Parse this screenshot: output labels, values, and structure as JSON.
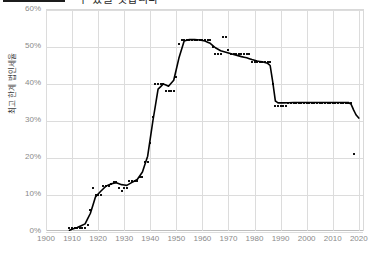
{
  "header": {
    "title_fragment": "수 있을 것입니다",
    "logo_name": "black-bar-logo"
  },
  "chart_data": {
    "type": "scatter",
    "title": "",
    "xlabel": "",
    "ylabel": "최고 한계 법인세율",
    "xlim": [
      1900,
      2022
    ],
    "ylim": [
      0,
      60
    ],
    "grid": true,
    "legend": "none",
    "xticks": [
      1900,
      1910,
      1920,
      1930,
      1940,
      1950,
      1960,
      1970,
      1980,
      1990,
      2000,
      2010,
      2020
    ],
    "xticklabels": [
      "1900",
      "1910",
      "1920",
      "1930",
      "1940",
      "1950",
      "1960",
      "1970",
      "1980",
      "1990",
      "2000",
      "2010",
      "2020"
    ],
    "yticks": [
      0,
      10,
      20,
      30,
      40,
      50,
      60
    ],
    "yticklabels": [
      "0%",
      "10%",
      "20%",
      "30%",
      "40%",
      "50%",
      "60%"
    ],
    "series": [
      {
        "name": "Top marginal corporate tax rate (observations)",
        "marker": "square",
        "color": "#111111",
        "points": [
          [
            1909,
            1.0
          ],
          [
            1910,
            1.0
          ],
          [
            1911,
            1.0
          ],
          [
            1912,
            1.0
          ],
          [
            1913,
            1.0
          ],
          [
            1914,
            1.0
          ],
          [
            1915,
            1.0
          ],
          [
            1916,
            2.0
          ],
          [
            1917,
            6.0
          ],
          [
            1918,
            12.0
          ],
          [
            1919,
            10.0
          ],
          [
            1920,
            10.0
          ],
          [
            1921,
            10.0
          ],
          [
            1922,
            12.5
          ],
          [
            1923,
            12.5
          ],
          [
            1924,
            12.5
          ],
          [
            1925,
            13.0
          ],
          [
            1926,
            13.5
          ],
          [
            1927,
            13.5
          ],
          [
            1928,
            12.0
          ],
          [
            1929,
            11.0
          ],
          [
            1930,
            12.0
          ],
          [
            1931,
            12.0
          ],
          [
            1932,
            13.75
          ],
          [
            1933,
            13.75
          ],
          [
            1934,
            13.75
          ],
          [
            1935,
            13.75
          ],
          [
            1936,
            15.0
          ],
          [
            1937,
            15.0
          ],
          [
            1938,
            19.0
          ],
          [
            1939,
            19.0
          ],
          [
            1940,
            24.0
          ],
          [
            1941,
            31.0
          ],
          [
            1942,
            40.0
          ],
          [
            1943,
            40.0
          ],
          [
            1944,
            40.0
          ],
          [
            1945,
            40.0
          ],
          [
            1946,
            38.0
          ],
          [
            1947,
            38.0
          ],
          [
            1948,
            38.0
          ],
          [
            1949,
            38.0
          ],
          [
            1950,
            42.0
          ],
          [
            1951,
            50.75
          ],
          [
            1952,
            52.0
          ],
          [
            1953,
            52.0
          ],
          [
            1954,
            52.0
          ],
          [
            1955,
            52.0
          ],
          [
            1956,
            52.0
          ],
          [
            1957,
            52.0
          ],
          [
            1958,
            52.0
          ],
          [
            1959,
            52.0
          ],
          [
            1960,
            52.0
          ],
          [
            1961,
            52.0
          ],
          [
            1962,
            52.0
          ],
          [
            1963,
            52.0
          ],
          [
            1964,
            50.0
          ],
          [
            1965,
            48.0
          ],
          [
            1966,
            48.0
          ],
          [
            1967,
            48.0
          ],
          [
            1968,
            52.8
          ],
          [
            1969,
            52.8
          ],
          [
            1970,
            49.2
          ],
          [
            1971,
            48.0
          ],
          [
            1972,
            48.0
          ],
          [
            1973,
            48.0
          ],
          [
            1974,
            48.0
          ],
          [
            1975,
            48.0
          ],
          [
            1976,
            48.0
          ],
          [
            1977,
            48.0
          ],
          [
            1978,
            48.0
          ],
          [
            1979,
            46.0
          ],
          [
            1980,
            46.0
          ],
          [
            1981,
            46.0
          ],
          [
            1982,
            46.0
          ],
          [
            1983,
            46.0
          ],
          [
            1984,
            46.0
          ],
          [
            1985,
            46.0
          ],
          [
            1986,
            46.0
          ],
          [
            1987,
            40.0
          ],
          [
            1988,
            34.0
          ],
          [
            1989,
            34.0
          ],
          [
            1990,
            34.0
          ],
          [
            1991,
            34.0
          ],
          [
            1992,
            34.0
          ],
          [
            1993,
            35.0
          ],
          [
            1994,
            35.0
          ],
          [
            1995,
            35.0
          ],
          [
            1996,
            35.0
          ],
          [
            1997,
            35.0
          ],
          [
            1998,
            35.0
          ],
          [
            1999,
            35.0
          ],
          [
            2000,
            35.0
          ],
          [
            2001,
            35.0
          ],
          [
            2002,
            35.0
          ],
          [
            2003,
            35.0
          ],
          [
            2004,
            35.0
          ],
          [
            2005,
            35.0
          ],
          [
            2006,
            35.0
          ],
          [
            2007,
            35.0
          ],
          [
            2008,
            35.0
          ],
          [
            2009,
            35.0
          ],
          [
            2010,
            35.0
          ],
          [
            2011,
            35.0
          ],
          [
            2012,
            35.0
          ],
          [
            2013,
            35.0
          ],
          [
            2014,
            35.0
          ],
          [
            2015,
            35.0
          ],
          [
            2016,
            35.0
          ],
          [
            2017,
            35.0
          ],
          [
            2018,
            21.0
          ]
        ]
      },
      {
        "name": "Fitted trend",
        "marker": "line",
        "color": "#000000",
        "points": [
          [
            1909,
            0.5
          ],
          [
            1912,
            1.2
          ],
          [
            1915,
            2.2
          ],
          [
            1917,
            5.0
          ],
          [
            1919,
            9.5
          ],
          [
            1921,
            11.0
          ],
          [
            1923,
            12.4
          ],
          [
            1925,
            13.0
          ],
          [
            1927,
            13.3
          ],
          [
            1929,
            12.8
          ],
          [
            1931,
            12.6
          ],
          [
            1933,
            13.4
          ],
          [
            1935,
            14.2
          ],
          [
            1937,
            16.2
          ],
          [
            1939,
            20.5
          ],
          [
            1941,
            30.0
          ],
          [
            1943,
            38.6
          ],
          [
            1945,
            40.0
          ],
          [
            1947,
            39.4
          ],
          [
            1949,
            41.0
          ],
          [
            1951,
            47.0
          ],
          [
            1953,
            51.6
          ],
          [
            1955,
            52.0
          ],
          [
            1957,
            52.0
          ],
          [
            1959,
            51.9
          ],
          [
            1961,
            51.6
          ],
          [
            1963,
            51.0
          ],
          [
            1965,
            49.8
          ],
          [
            1967,
            49.0
          ],
          [
            1969,
            48.6
          ],
          [
            1971,
            48.2
          ],
          [
            1973,
            47.8
          ],
          [
            1975,
            47.4
          ],
          [
            1977,
            47.1
          ],
          [
            1979,
            46.6
          ],
          [
            1981,
            46.2
          ],
          [
            1983,
            46.0
          ],
          [
            1985,
            45.6
          ],
          [
            1986,
            45.0
          ],
          [
            1987,
            40.5
          ],
          [
            1988,
            35.4
          ],
          [
            1989,
            34.9
          ],
          [
            1991,
            34.9
          ],
          [
            1995,
            35.0
          ],
          [
            2000,
            35.0
          ],
          [
            2005,
            35.0
          ],
          [
            2010,
            35.0
          ],
          [
            2014,
            35.0
          ],
          [
            2016,
            35.0
          ],
          [
            2017,
            34.6
          ],
          [
            2018,
            33.0
          ],
          [
            2019,
            31.6
          ],
          [
            2020,
            30.8
          ]
        ]
      }
    ]
  }
}
